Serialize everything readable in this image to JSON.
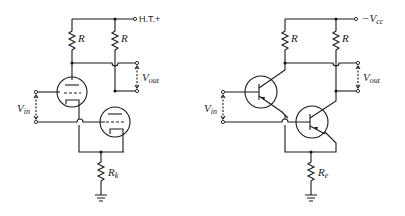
{
  "diagrams": [
    {
      "name": "vacuum-tube-long-tailed-pair",
      "supply_label": "H.T.+",
      "resistor_labels": [
        "R",
        "R"
      ],
      "tail_resistor": {
        "symbol": "R",
        "subscript": "k"
      },
      "input_label": {
        "symbol": "V",
        "subscript": "in"
      },
      "output_label": {
        "symbol": "V",
        "subscript": "out"
      }
    },
    {
      "name": "transistor-long-tailed-pair",
      "supply_label": {
        "prefix": "−V",
        "subscript": "cc"
      },
      "resistor_labels": [
        "R",
        "R"
      ],
      "tail_resistor": {
        "symbol": "R",
        "subscript": "e"
      },
      "input_label": {
        "symbol": "V",
        "subscript": "in"
      },
      "output_label": {
        "symbol": "V",
        "subscript": "out"
      }
    }
  ]
}
